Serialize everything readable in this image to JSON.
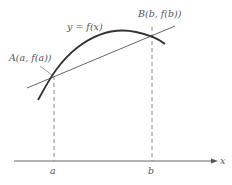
{
  "diagram": {
    "type": "mean-value-theorem-secant",
    "curve_label": "y = f(x)",
    "point_a_label": "A(a, f(a))",
    "point_b_label": "B(b, f(b))",
    "x_axis_label": "x",
    "tick_a_label": "a",
    "tick_b_label": "b",
    "colors": {
      "curve": "#333333",
      "secant": "#555555",
      "axis": "#666666",
      "dashed": "#888888",
      "text": "#555555"
    }
  }
}
